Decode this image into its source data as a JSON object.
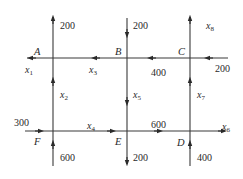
{
  "diagram": {
    "type": "traffic-flow-network",
    "colors": {
      "line": "#3a3a3a",
      "text": "#2a2a2a",
      "background": "#ffffff"
    },
    "nodes": {
      "A": {
        "label": "A"
      },
      "B": {
        "label": "B"
      },
      "C": {
        "label": "C"
      },
      "D": {
        "label": "D"
      },
      "E": {
        "label": "E"
      },
      "F": {
        "label": "F"
      }
    },
    "flows": {
      "top_left_out": "200",
      "top_middle_in": "200",
      "top_right_out_var": "x",
      "top_right_out_sub": "8",
      "right_top_in": "200",
      "c_to_b": "400",
      "b_to_a_var": "x",
      "b_to_a_sub": "3",
      "a_left_out_var": "x",
      "a_left_out_sub": "1",
      "f_to_a_var": "x",
      "f_to_a_sub": "2",
      "b_to_e_var": "x",
      "b_to_e_sub": "5",
      "d_to_c_var": "x",
      "d_to_c_sub": "7",
      "left_bottom_in": "300",
      "f_to_e_var": "x",
      "f_to_e_sub": "4",
      "e_to_d": "600",
      "d_right_out_var": "x",
      "d_right_out_sub": "6",
      "bottom_left_in": "600",
      "bottom_middle_out": "200",
      "bottom_right_in": "400"
    }
  }
}
